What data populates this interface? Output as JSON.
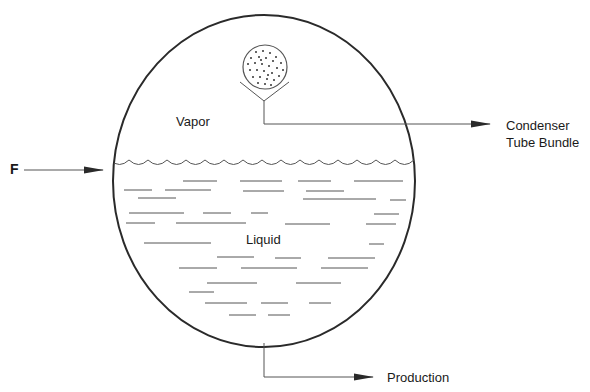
{
  "diagram": {
    "type": "flash evaporator drum cross-section",
    "labels": {
      "vapor": "Vapor",
      "liquid": "Liquid",
      "feed": "F",
      "condenser_line1": "Condenser",
      "condenser_line2": "Tube Bundle",
      "production": "Production"
    },
    "colors": {
      "stroke": "#2a2a2a",
      "fill": "#ffffff"
    },
    "components": [
      {
        "id": "vessel",
        "shape": "circle",
        "label": ""
      },
      {
        "id": "tube-bundle",
        "shape": "dotted circle",
        "label": "Condenser Tube Bundle"
      },
      {
        "id": "feed-inlet",
        "shape": "arrow",
        "label": "F"
      },
      {
        "id": "condensate-outlet",
        "shape": "arrow",
        "label": "Condenser Tube Bundle"
      },
      {
        "id": "production-outlet",
        "shape": "arrow",
        "label": "Production"
      }
    ]
  }
}
